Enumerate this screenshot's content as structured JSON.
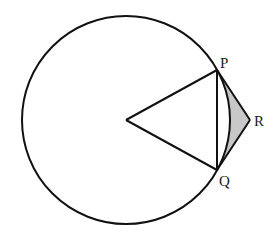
{
  "diagram": {
    "circle": {
      "cx": 126,
      "cy": 120,
      "r": 104
    },
    "points": {
      "center": {
        "x": 126,
        "y": 120,
        "label": ""
      },
      "P": {
        "x": 217,
        "y": 70,
        "label": "P"
      },
      "Q": {
        "x": 217,
        "y": 170,
        "label": "Q"
      },
      "R": {
        "x": 250,
        "y": 120,
        "label": "R"
      }
    },
    "segments": [
      "OP",
      "OQ",
      "PQ",
      "PR",
      "QR"
    ],
    "shaded_region": "between arc PQ and tangents PR, QR",
    "colors": {
      "stroke": "#111111",
      "shade": "#c8c8c8",
      "background": "#ffffff"
    }
  }
}
